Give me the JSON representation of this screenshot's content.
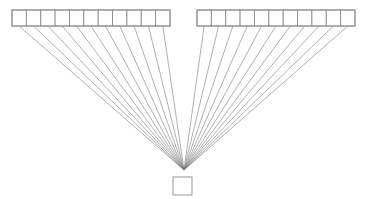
{
  "canvas": {
    "width": 367,
    "height": 199,
    "background": "#ffffff"
  },
  "style": {
    "stroke_color": "#8c8c8c",
    "cell_stroke_width": 0.9,
    "edge_stroke_color": "#7a7a7a",
    "edge_stroke_width": 0.6,
    "fill_color": "#ffffff"
  },
  "chart_data": {
    "type": "diagram",
    "title": "",
    "convergence_point": {
      "x": 184,
      "y": 170
    },
    "groups": [
      {
        "name": "left-array",
        "label": "",
        "cell_count": 11,
        "x": 12,
        "y": 10,
        "width": 158,
        "height": 16,
        "cell_width": 14.36
      },
      {
        "name": "right-array",
        "label": "",
        "cell_count": 11,
        "x": 197,
        "y": 10,
        "width": 158,
        "height": 16,
        "cell_width": 14.36
      }
    ],
    "sink": {
      "name": "sink-node",
      "label": "",
      "x": 173,
      "y": 177,
      "width": 19,
      "height": 18
    },
    "edges_per_group": 11,
    "total_edges": 22
  }
}
